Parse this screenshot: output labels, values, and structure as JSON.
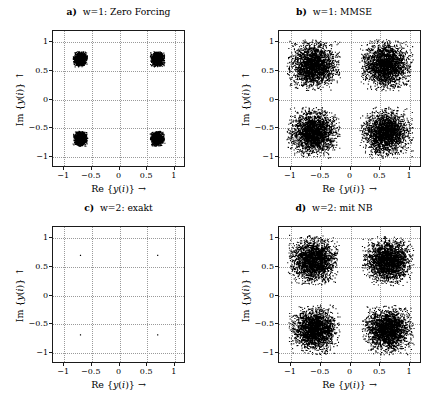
{
  "figure": {
    "width": 443,
    "height": 399,
    "background": "#ffffff",
    "point_color": "#000000",
    "axis_color": "#1a1a1a",
    "grid_color": "#9a9a9a"
  },
  "chart_data": [
    {
      "type": "scatter",
      "id": "panel-a",
      "title": "a) w=1: Zero Forcing",
      "title_prefix": "a)",
      "title_text": "w=1: Zero Forcing",
      "xlabel": "Re {y(i)} →",
      "ylabel": "Im {y(i)} ↑",
      "xlim": [
        -1.2,
        1.2
      ],
      "ylim": [
        -1.2,
        1.2
      ],
      "xticks": [
        -1,
        -0.5,
        0,
        0.5,
        1
      ],
      "xticklabels": [
        "−1",
        "−0.5",
        "0",
        "0.5",
        "1"
      ],
      "yticks": [
        -1,
        -0.5,
        0,
        0.5,
        1
      ],
      "yticklabels": [
        "−1",
        "−0.5",
        "0",
        "0.5",
        "1"
      ],
      "grid": true,
      "legend": null,
      "marker": "dot",
      "marker_size": 0.55,
      "n_points_per_cluster": 1400,
      "cluster_centers": [
        [
          -0.7071,
          0.7071
        ],
        [
          0.7071,
          0.7071
        ],
        [
          -0.7071,
          -0.7071
        ],
        [
          0.7071,
          -0.7071
        ]
      ],
      "cluster_sigma": 0.052,
      "description": "Four tight QPSK clusters at (±0.71, ±0.71) with small noise spread"
    },
    {
      "type": "scatter",
      "id": "panel-b",
      "title": "b) w=1: MMSE",
      "title_prefix": "b)",
      "title_text": "w=1: MMSE",
      "xlabel": "Re {y(i)} →",
      "ylabel": "Im {y(i)} ↑",
      "xlim": [
        -1.2,
        1.2
      ],
      "ylim": [
        -1.2,
        1.2
      ],
      "xticks": [
        -1,
        -0.5,
        0,
        0.5,
        1
      ],
      "xticklabels": [
        "−1",
        "−0.5",
        "0",
        "0.5",
        "1"
      ],
      "yticks": [
        -1,
        -0.5,
        0,
        0.5,
        1
      ],
      "yticklabels": [
        "−1",
        "−0.5",
        "0",
        "0.5",
        "1"
      ],
      "grid": true,
      "legend": null,
      "marker": "dot",
      "marker_size": 0.55,
      "n_points_per_cluster": 2600,
      "cluster_centers": [
        [
          -0.62,
          0.6
        ],
        [
          0.62,
          0.6
        ],
        [
          -0.62,
          -0.6
        ],
        [
          0.62,
          -0.6
        ]
      ],
      "cluster_sigma": 0.175,
      "description": "Four broad noisy QPSK clusters at (±0.62, ±0.60) with large noise spread"
    },
    {
      "type": "scatter",
      "id": "panel-c",
      "title": "c) w=2: exakt",
      "title_prefix": "c)",
      "title_text": "w=2: exakt",
      "xlabel": "Re {y(i)} →",
      "ylabel": "Im {y(i)} ↑",
      "xlim": [
        -1.2,
        1.2
      ],
      "ylim": [
        -1.2,
        1.2
      ],
      "xticks": [
        -1,
        -0.5,
        0,
        0.5,
        1
      ],
      "xticklabels": [
        "−1",
        "−0.5",
        "0",
        "0.5",
        "1"
      ],
      "yticks": [
        -1,
        -0.5,
        0,
        0.5,
        1
      ],
      "yticklabels": [
        "−1",
        "−0.5",
        "0",
        "0.5",
        "1"
      ],
      "grid": true,
      "legend": null,
      "marker": "dot",
      "marker_size": 0.6,
      "n_points_per_cluster": 1,
      "cluster_centers": [
        [
          -0.7071,
          0.7071
        ],
        [
          0.7071,
          0.7071
        ],
        [
          -0.7071,
          -0.7071
        ],
        [
          0.7071,
          -0.7071
        ]
      ],
      "cluster_sigma": 0.0,
      "description": "Ideal noise-free constellation: four single points at (±0.71, ±0.71)"
    },
    {
      "type": "scatter",
      "id": "panel-d",
      "title": "d) w=2: mit NB",
      "title_prefix": "d)",
      "title_text": "w=2: mit NB",
      "xlabel": "Re {y(i)} →",
      "ylabel": "Im {y(i)} ↑",
      "xlim": [
        -1.2,
        1.2
      ],
      "ylim": [
        -1.2,
        1.2
      ],
      "xticks": [
        -1,
        -0.5,
        0,
        0.5,
        1
      ],
      "xticklabels": [
        "−1",
        "−0.5",
        "0",
        "0.5",
        "1"
      ],
      "yticks": [
        -1,
        -0.5,
        0,
        0.5,
        1
      ],
      "yticklabels": [
        "−1",
        "−0.5",
        "0",
        "0.5",
        "1"
      ],
      "grid": true,
      "legend": null,
      "marker": "dot",
      "marker_size": 0.55,
      "n_points_per_cluster": 2600,
      "cluster_centers": [
        [
          -0.62,
          0.62
        ],
        [
          0.65,
          0.6
        ],
        [
          -0.6,
          -0.62
        ],
        [
          0.65,
          -0.62
        ]
      ],
      "cluster_sigma": 0.17,
      "description": "Four broad noisy QPSK clusters with noise enhancement"
    }
  ],
  "panel_geometry": [
    {
      "id": "panel-a",
      "box_left": 52,
      "box_top": 30,
      "box_width": 133,
      "box_height": 137,
      "title_top": 6,
      "title_left": 0,
      "title_width": 237
    },
    {
      "id": "panel-b",
      "box_left": 278,
      "box_top": 30,
      "box_width": 143,
      "box_height": 137,
      "title_top": 6,
      "title_left": 225,
      "title_width": 218
    },
    {
      "id": "panel-c",
      "box_left": 52,
      "box_top": 226,
      "box_width": 133,
      "box_height": 137,
      "title_top": 202,
      "title_left": 0,
      "title_width": 237
    },
    {
      "id": "panel-d",
      "box_left": 278,
      "box_top": 226,
      "box_width": 143,
      "box_height": 137,
      "title_top": 202,
      "title_left": 225,
      "title_width": 218
    }
  ]
}
